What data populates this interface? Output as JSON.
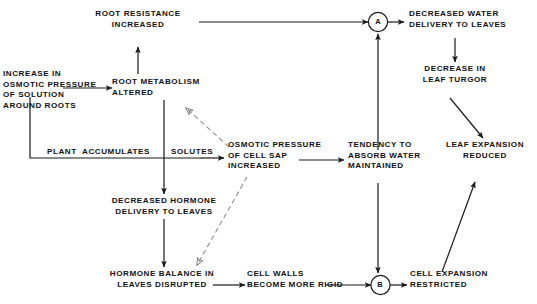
{
  "diagram": {
    "stroke_color": "#1a1a1a",
    "background_color": "#ffffff",
    "nodes": [
      {
        "id": "root-resistance-increased",
        "label": "ROOT RESISTANCE\nINCREASED"
      },
      {
        "id": "increase-osmotic-pressure",
        "label": "INCREASE IN\nOSMOTIC PRESSURE\nOF SOLUTION\nAROUND ROOTS"
      },
      {
        "id": "root-metabolism-altered",
        "label": "ROOT METABOLISM\nALTERED"
      },
      {
        "id": "decreased-water-delivery",
        "label": "DECREASED WATER\nDELIVERY TO LEAVES"
      },
      {
        "id": "decrease-in-leaf-turgor",
        "label": "DECREASE IN\nLEAF TURGOR"
      },
      {
        "id": "osmotic-pressure-cell-sap",
        "label": "OSMOTIC PRESSURE\nOF CELL SAP\nINCREASED"
      },
      {
        "id": "tendency-absorb-water",
        "label": "TENDENCY TO\nABSORB WATER\nMAINTAINED"
      },
      {
        "id": "leaf-expansion-reduced",
        "label": "LEAF EXPANSION\nREDUCED"
      },
      {
        "id": "decreased-hormone-delivery",
        "label": "DECREASED HORMONE\nDELIVERY TO LEAVES"
      },
      {
        "id": "hormone-balance-disrupted",
        "label": "HORMONE BALANCE IN\nLEAVES DISRUPTED"
      },
      {
        "id": "cell-walls-more-rigid",
        "label": "CELL WALLS\nBECOME MORE RIGID"
      },
      {
        "id": "cell-expansion-restricted",
        "label": "CELL EXPANSION\nRESTRICTED"
      }
    ],
    "edge_labels": [
      {
        "id": "plant-accumulates",
        "label": "PLANT  ACCUMULATES"
      },
      {
        "id": "solutes",
        "label": "SOLUTES"
      }
    ],
    "junctions": [
      {
        "id": "junction-a",
        "label": "A"
      },
      {
        "id": "junction-b",
        "label": "B"
      }
    ]
  }
}
